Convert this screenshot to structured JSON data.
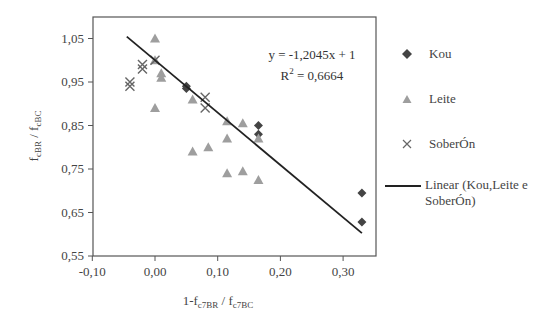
{
  "chart_data": {
    "type": "scatter",
    "title": "",
    "xlabel": "1-f_c7BR / f_c7BC",
    "ylabel": "f_cBR / f_cBC",
    "xlim": [
      -0.1,
      0.35
    ],
    "ylim": [
      0.55,
      1.1
    ],
    "grid": false,
    "legend_position": "right",
    "x_ticks": [
      "-0,10",
      "0,00",
      "0,10",
      "0,20",
      "0,30"
    ],
    "y_ticks": [
      "0,55",
      "0,65",
      "0,75",
      "0,85",
      "0,95",
      "1,05"
    ],
    "series": [
      {
        "name": "Kou",
        "marker": "diamond",
        "color": "#444444",
        "points": [
          [
            0.05,
            0.94
          ],
          [
            0.05,
            0.935
          ],
          [
            0.165,
            0.85
          ],
          [
            0.165,
            0.83
          ],
          [
            0.33,
            0.695
          ],
          [
            0.33,
            0.628
          ]
        ]
      },
      {
        "name": "Leite",
        "marker": "triangle",
        "color": "#9e9e9e",
        "points": [
          [
            0.0,
            1.05
          ],
          [
            0.0,
            1.0
          ],
          [
            0.01,
            0.97
          ],
          [
            0.01,
            0.96
          ],
          [
            0.0,
            0.89
          ],
          [
            0.06,
            0.91
          ],
          [
            0.06,
            0.79
          ],
          [
            0.085,
            0.8
          ],
          [
            0.115,
            0.86
          ],
          [
            0.115,
            0.82
          ],
          [
            0.115,
            0.74
          ],
          [
            0.14,
            0.855
          ],
          [
            0.14,
            0.745
          ],
          [
            0.165,
            0.82
          ],
          [
            0.165,
            0.725
          ]
        ]
      },
      {
        "name": "SoberÓn",
        "marker": "x",
        "color": "#666666",
        "points": [
          [
            -0.04,
            0.95
          ],
          [
            -0.04,
            0.94
          ],
          [
            -0.02,
            0.99
          ],
          [
            -0.02,
            0.98
          ],
          [
            0.0,
            1.0
          ],
          [
            0.08,
            0.915
          ],
          [
            0.08,
            0.89
          ]
        ]
      }
    ],
    "trendline": {
      "name": "Linear (Kou,Leite e SoberÓn)",
      "slope": -1.2045,
      "intercept": 1,
      "x_range": [
        -0.045,
        0.33
      ],
      "equation": "y = -1,2045x + 1",
      "r2_label": "R",
      "r2_sup": "2",
      "r2_value": " = 0,6664"
    }
  },
  "axes": {
    "x_title_main": "1-f",
    "x_title_sub1": "c7BR",
    "x_title_mid": " / f",
    "x_title_sub2": "c7BC",
    "y_title_main1": "f",
    "y_title_sub1": "cBR",
    "y_title_mid": " / f",
    "y_title_sub2": "cBC"
  },
  "legend": {
    "items": [
      {
        "label": "Kou"
      },
      {
        "label": "Leite"
      },
      {
        "label": "SoberÓn"
      },
      {
        "label": "Linear (Kou,Leite e SoberÓn)"
      }
    ]
  }
}
